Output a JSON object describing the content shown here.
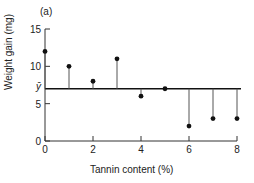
{
  "chart_data": {
    "type": "scatter",
    "title": "(a)",
    "xlabel": "Tannin content (%)",
    "ylabel": "Weight gain (mg)",
    "x": [
      0,
      1,
      2,
      3,
      4,
      5,
      6,
      7,
      8
    ],
    "series": [
      {
        "name": "Weight gain",
        "values": [
          12,
          10,
          8,
          11,
          6,
          7,
          2,
          3,
          3
        ]
      }
    ],
    "mean_line": {
      "label": "ȳ",
      "value": 7
    },
    "residual_lines": true,
    "xlim": [
      0,
      8
    ],
    "ylim": [
      0,
      15
    ],
    "xticks": [
      0,
      2,
      4,
      6,
      8
    ],
    "yticks": [
      0,
      5,
      10,
      15
    ],
    "grid": false,
    "legend": "none"
  }
}
